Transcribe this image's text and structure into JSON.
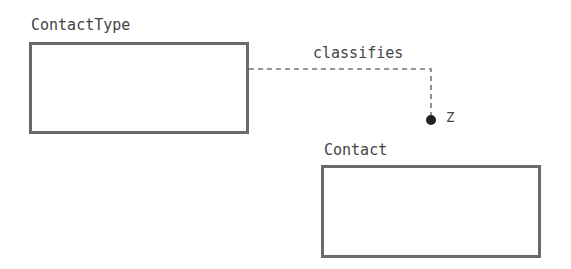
{
  "diagram": {
    "entities": [
      {
        "name": "ContactType"
      },
      {
        "name": "Contact"
      }
    ],
    "relationship": {
      "label": "classifies",
      "cardinality": "Z",
      "from": "ContactType",
      "to": "Contact",
      "style": "dashed"
    },
    "colors": {
      "border": "#6a6a6a",
      "text": "#444444",
      "line": "#777777",
      "dot": "#222222"
    }
  }
}
